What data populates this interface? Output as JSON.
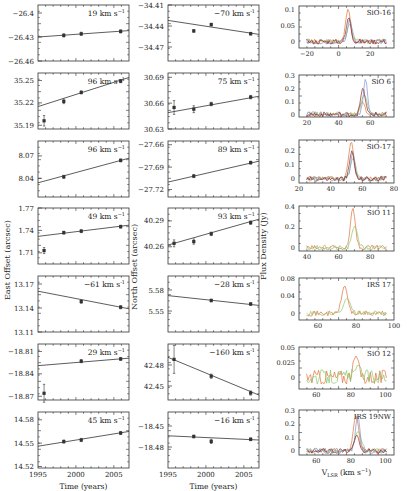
{
  "figure": {
    "left_ylabel": "East Offset (arcsec)",
    "middle_ylabel": "North Offset (arcsec)",
    "right_ylabel": "Flux Density (Jy)",
    "left_xlabel": "Time (years)",
    "middle_xlabel": "Time (years)",
    "right_xlabel": "V_LSR (km s^-1)",
    "time_ticks": [
      "1995",
      "2000",
      "2005"
    ]
  },
  "chart_data": [
    {
      "type": "scatter",
      "column": "East Offset",
      "ylabel": "East Offset (arcsec)",
      "xlabel": "Time (years)",
      "xlim": [
        1995,
        2007
      ],
      "panels": [
        {
          "label": "19 km s^-1",
          "yticks": [
            "-26.4",
            "-26.43",
            "-26.46"
          ],
          "ylim": [
            -26.46,
            -26.39
          ],
          "points": [
            [
              1998.4,
              -26.428
            ],
            [
              2000.7,
              -26.426
            ],
            [
              2005.9,
              -26.423
            ]
          ],
          "errs": [
            0.002,
            0.002,
            0.002
          ],
          "fit": [
            [
              1995,
              -26.43
            ],
            [
              2007,
              -26.422
            ]
          ]
        },
        {
          "label": "96 km s^-1",
          "yticks": [
            "35.25",
            "35.22",
            "35.19"
          ],
          "ylim": [
            35.185,
            35.26
          ],
          "points": [
            [
              1995.8,
              35.196
            ],
            [
              1998.4,
              35.222
            ],
            [
              2000.7,
              35.234
            ],
            [
              2005.9,
              35.249
            ]
          ],
          "errs": [
            0.007,
            0.003,
            0.002,
            0.002
          ],
          "fit": [
            [
              1995,
              35.215
            ],
            [
              2007,
              35.254
            ]
          ]
        },
        {
          "label": "96 km s^-1",
          "yticks": [
            "8.07",
            "8.04"
          ],
          "ylim": [
            8.015,
            8.09
          ],
          "points": [
            [
              1998.4,
              8.042
            ],
            [
              2005.9,
              8.064
            ]
          ],
          "errs": [
            0.002,
            0.002
          ],
          "fit": [
            [
              1995,
              8.034
            ],
            [
              2007,
              8.067
            ]
          ]
        },
        {
          "label": "49 km s^-1",
          "yticks": [
            "1.77",
            "1.74",
            "1.71"
          ],
          "ylim": [
            1.695,
            1.77
          ],
          "points": [
            [
              1995.8,
              1.713
            ],
            [
              1998.4,
              1.737
            ],
            [
              2000.7,
              1.739
            ],
            [
              2005.9,
              1.745
            ]
          ],
          "errs": [
            0.004,
            0.002,
            0.002,
            0.002
          ],
          "fit": [
            [
              1995,
              1.732
            ],
            [
              2007,
              1.747
            ]
          ]
        },
        {
          "label": "-61 km s^-1",
          "yticks": [
            "13.17",
            "13.14",
            "13.11"
          ],
          "ylim": [
            13.11,
            13.18
          ],
          "points": [
            [
              2000.7,
              13.148
            ],
            [
              2005.9,
              13.141
            ]
          ],
          "errs": [
            0.002,
            0.002
          ],
          "fit": [
            [
              1995,
              13.161
            ],
            [
              2007,
              13.139
            ]
          ]
        },
        {
          "label": "29 km s^-1",
          "yticks": [
            "-18.81",
            "-18.84",
            "-18.87"
          ],
          "ylim": [
            -18.875,
            -18.8
          ],
          "points": [
            [
              1995.8,
              -18.866
            ],
            [
              2000.7,
              -18.823
            ],
            [
              2005.9,
              -18.82
            ]
          ],
          "errs": [
            0.012,
            0.002,
            0.002
          ],
          "fit": [
            [
              1995,
              -18.829
            ],
            [
              2007,
              -18.819
            ]
          ]
        },
        {
          "label": "45 km s^-1",
          "yticks": [
            "14.58",
            "14.55",
            "14.52"
          ],
          "ylim": [
            14.518,
            14.59
          ],
          "points": [
            [
              1998.4,
              14.552
            ],
            [
              2000.7,
              14.554
            ],
            [
              2005.9,
              14.563
            ]
          ],
          "errs": [
            0.002,
            0.002,
            0.002
          ],
          "fit": [
            [
              1995,
              14.546
            ],
            [
              2007,
              14.565
            ]
          ]
        }
      ]
    },
    {
      "type": "scatter",
      "column": "North Offset",
      "ylabel": "North Offset (arcsec)",
      "xlabel": "Time (years)",
      "xlim": [
        1995,
        2007
      ],
      "panels": [
        {
          "label": "-70 km s^-1",
          "yticks": [
            "-34.41",
            "-34.44",
            "-34.47"
          ],
          "ylim": [
            -34.49,
            -34.41
          ],
          "points": [
            [
              1998.4,
              -34.447
            ],
            [
              2000.7,
              -34.438
            ],
            [
              2005.9,
              -34.451
            ]
          ],
          "errs": [
            0.002,
            0.002,
            0.002
          ],
          "fit": [
            [
              1995,
              -34.432
            ],
            [
              2007,
              -34.452
            ]
          ]
        },
        {
          "label": "75 km s^-1",
          "yticks": [
            "30.69",
            "30.66",
            "30.63"
          ],
          "ylim": [
            30.63,
            30.695
          ],
          "points": [
            [
              1995.8,
              30.655
            ],
            [
              1998.4,
              30.653
            ],
            [
              2000.7,
              30.659
            ],
            [
              2005.9,
              30.667
            ]
          ],
          "errs": [
            0.008,
            0.004,
            0.002,
            0.002
          ],
          "fit": [
            [
              1995,
              30.649
            ],
            [
              2007,
              30.668
            ]
          ]
        },
        {
          "label": "89 km s^-1",
          "yticks": [
            "-27.66",
            "-27.69",
            "-27.72"
          ],
          "ylim": [
            -27.73,
            -27.655
          ],
          "points": [
            [
              1998.4,
              -27.702
            ],
            [
              2005.9,
              -27.684
            ]
          ],
          "errs": [
            0.002,
            0.002
          ],
          "fit": [
            [
              1995,
              -27.71
            ],
            [
              2007,
              -27.682
            ]
          ]
        },
        {
          "label": "93 km s^-1",
          "yticks": [
            "40.29",
            "40.26"
          ],
          "ylim": [
            40.24,
            40.305
          ],
          "points": [
            [
              1995.8,
              40.264
            ],
            [
              1998.4,
              40.266
            ],
            [
              2000.7,
              40.275
            ],
            [
              2005.9,
              40.288
            ]
          ],
          "errs": [
            0.004,
            0.003,
            0.002,
            0.002
          ],
          "fit": [
            [
              1995,
              40.262
            ],
            [
              2007,
              40.292
            ]
          ]
        },
        {
          "label": "-28 km s^-1",
          "yticks": [
            "5.58",
            "5.55"
          ],
          "ylim": [
            5.52,
            5.6
          ],
          "points": [
            [
              2000.7,
              5.565
            ],
            [
              2005.9,
              5.56
            ]
          ],
          "errs": [
            0.002,
            0.002
          ],
          "fit": [
            [
              1995,
              5.572
            ],
            [
              2007,
              5.558
            ]
          ]
        },
        {
          "label": "-160 km s^-1",
          "yticks": [
            "42.48",
            "42.45"
          ],
          "ylim": [
            42.43,
            42.51
          ],
          "points": [
            [
              1995.8,
              42.488
            ],
            [
              2000.7,
              42.464
            ],
            [
              2005.9,
              42.44
            ]
          ],
          "errs": [
            0.02,
            0.003,
            0.003
          ],
          "fit": [
            [
              1995,
              42.491
            ],
            [
              2007,
              42.437
            ]
          ]
        },
        {
          "label": "-16 km s^-1",
          "yticks": [
            "-18.45",
            "-18.48"
          ],
          "ylim": [
            -18.51,
            -18.43
          ],
          "points": [
            [
              1998.4,
              -18.465
            ],
            [
              2000.7,
              -18.472
            ],
            [
              2005.9,
              -18.469
            ]
          ],
          "errs": [
            0.002,
            0.003,
            0.002
          ],
          "fit": [
            [
              1995,
              -18.464
            ],
            [
              2007,
              -18.47
            ]
          ]
        }
      ]
    },
    {
      "type": "line",
      "column": "Spectra",
      "ylabel": "Flux Density (Jy)",
      "xlabel": "V_LSR (km s^-1)",
      "series_colors": {
        "epoch1": "#e0733a",
        "epoch2": "#8fc46b",
        "epoch3": "#7c93d6",
        "epoch4": "#8b2a2a"
      },
      "panels": [
        {
          "label": "SiO-16",
          "xticks": [
            "-20",
            "0",
            "20"
          ],
          "xlim": [
            -25,
            35
          ],
          "yticks": [
            "0.1",
            "0.05",
            "0"
          ],
          "ylim": [
            -0.02,
            0.11
          ],
          "peak_v": 6,
          "peak_flux": 0.1
        },
        {
          "label": "SiO 6",
          "xticks": [
            "20",
            "40",
            "60"
          ],
          "xlim": [
            15,
            75
          ],
          "yticks": [
            "0.3",
            "0.2",
            "0.1",
            "0"
          ],
          "ylim": [
            -0.02,
            0.3
          ],
          "peak_v": 55,
          "peak_flux": 0.27
        },
        {
          "label": "SiO-17",
          "xticks": [
            "20",
            "40",
            "60",
            "80"
          ],
          "xlim": [
            20,
            80
          ],
          "yticks": [
            "0.2",
            "0.1",
            "0"
          ],
          "ylim": [
            -0.03,
            0.27
          ],
          "peak_v": 53,
          "peak_flux": 0.26
        },
        {
          "label": "SiO 11",
          "xticks": [
            "40",
            "60",
            "80"
          ],
          "xlim": [
            35,
            95
          ],
          "yticks": [
            "0.4",
            "0.2",
            "0"
          ],
          "ylim": [
            -0.03,
            0.4
          ],
          "peak_v": 69,
          "peak_flux": 0.38
        },
        {
          "label": "IRS 17",
          "xticks": [
            "60",
            "80",
            "100"
          ],
          "xlim": [
            50,
            100
          ],
          "yticks": [
            "0.08",
            "0.04",
            "0"
          ],
          "ylim": [
            -0.015,
            0.08
          ],
          "peak_v": 74,
          "peak_flux": 0.062
        },
        {
          "label": "SiO 12",
          "xticks": [
            "60",
            "80",
            "100"
          ],
          "xlim": [
            50,
            105
          ],
          "yticks": [
            "0.05",
            "0.025",
            "0"
          ],
          "ylim": [
            -0.02,
            0.05
          ],
          "peak_v": 83,
          "peak_flux": 0.035
        },
        {
          "label": "IRS 19NW",
          "xticks": [
            "60",
            "80",
            "100"
          ],
          "xlim": [
            50,
            105
          ],
          "yticks": [
            "0.3",
            "0.2",
            "0.1",
            "0"
          ],
          "ylim": [
            -0.03,
            0.3
          ],
          "peak_v": 83,
          "peak_flux": 0.26
        }
      ]
    }
  ]
}
